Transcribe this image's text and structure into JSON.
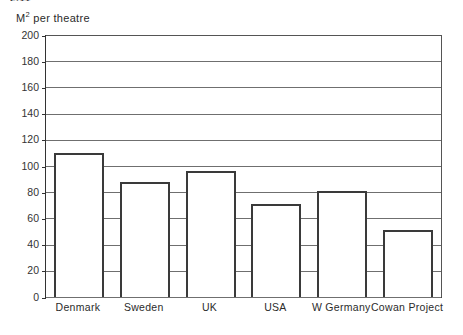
{
  "top_clipped_caption": "2.11",
  "axis": {
    "y_caption_prefix": "M",
    "y_caption_sup": "2",
    "y_caption_suffix": " per theatre"
  },
  "chart_data": {
    "type": "bar",
    "title": "",
    "subtitle": "",
    "xlabel": "",
    "ylabel": "M2 per theatre",
    "ylim": [
      0,
      200
    ],
    "ytick_step": 20,
    "yticks": [
      0,
      20,
      40,
      60,
      80,
      100,
      120,
      140,
      160,
      180,
      200
    ],
    "ytick_labels": [
      "0",
      "20",
      "40",
      "60",
      "80",
      "100",
      "120",
      "140",
      "160",
      "180",
      "200"
    ],
    "grid": true,
    "grid_axis": "y",
    "legend": false,
    "legend_position": "none",
    "categories": [
      "Denmark",
      "Sweden",
      "UK",
      "USA",
      "W Germany",
      "Cowan Project"
    ],
    "values": [
      110,
      88,
      96,
      71,
      81,
      51
    ],
    "bar_style": {
      "fill": "#ffffff",
      "edge": "#3a3a3a",
      "edge_width_px": 2
    }
  },
  "colors": {
    "background": "#ffffff",
    "axis_line": "#333333",
    "gridline": "#6f6f6f",
    "bar_edge": "#3a3a3a",
    "bar_fill": "#ffffff",
    "text": "#2b2b2b"
  }
}
